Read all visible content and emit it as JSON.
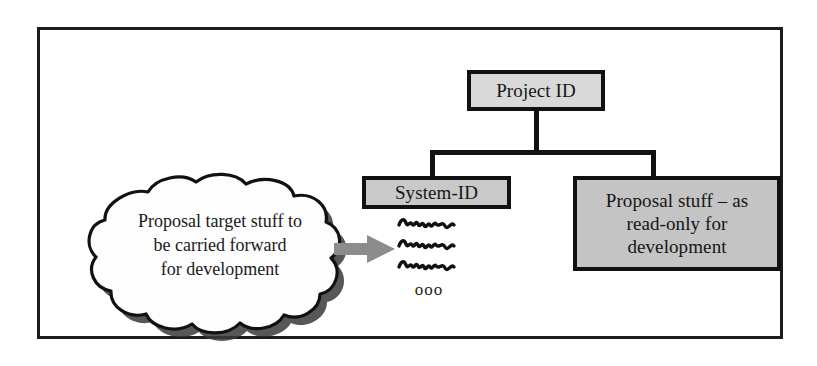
{
  "diagram": {
    "frame": {
      "border_color": "#1c1c1c"
    },
    "nodes": {
      "project_id": {
        "label": "Project ID",
        "fill": "#d9d9d9",
        "border": "#111111"
      },
      "system_id": {
        "label": "System-ID",
        "fill": "#c9c9c9",
        "border": "#111111"
      },
      "proposal_readonly": {
        "line1": "Proposal stuff – as",
        "line2": "read-only for",
        "line3": "development",
        "fill": "#c4c4c4",
        "border": "#111111"
      }
    },
    "cloud": {
      "line1": "Proposal target stuff to",
      "line2": "be carried forward",
      "line3": "for development",
      "fill": "#ffffff",
      "outline": "#111111",
      "shadow": "#3a3a3a"
    },
    "arrow": {
      "name": "flow-arrow",
      "direction": "right",
      "color": "#8c8c8c"
    },
    "scribbles": {
      "count": 3,
      "color": "#111111",
      "caption": "ooo"
    }
  }
}
